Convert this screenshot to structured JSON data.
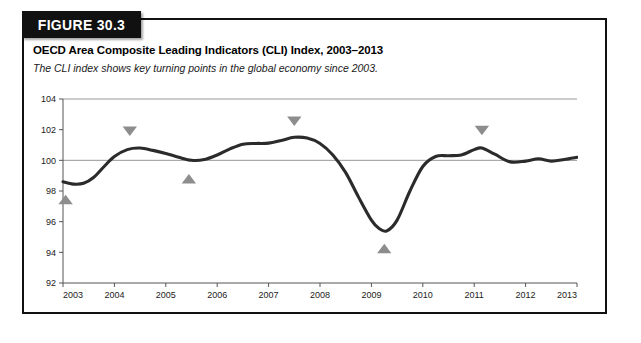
{
  "figure": {
    "banner_label": "FIGURE 30.3",
    "title": "OECD Area Composite Leading Indicators (CLI) Index, 2003–2013",
    "subtitle": "The CLI index shows key turning points in the global economy since 2003."
  },
  "colors": {
    "banner_background": "#111111",
    "banner_text": "#ffffff",
    "series_line": "#2b2b2b",
    "marker_gray": "#8d8d8d",
    "gridline": "#8c8c8c",
    "frame_border": "#111111"
  },
  "chart_data": {
    "type": "line",
    "title": "OECD Area Composite Leading Indicators (CLI) Index, 2003–2013",
    "subtitle": "The CLI index shows key turning points in the global economy since 2003.",
    "xlabel": "",
    "ylabel": "",
    "xlim": [
      2003,
      2013
    ],
    "ylim": [
      92,
      104
    ],
    "ytick_labels": [
      "92",
      "94",
      "96",
      "98",
      "100",
      "102",
      "104"
    ],
    "yticks": [
      92,
      94,
      96,
      98,
      100,
      102,
      104
    ],
    "xtick_labels": [
      "2003",
      "2004",
      "2005",
      "2006",
      "2007",
      "2008",
      "2009",
      "2010",
      "2011",
      "2012",
      "2013"
    ],
    "xticks": [
      2003,
      2004,
      2005,
      2006,
      2007,
      2008,
      2009,
      2010,
      2011,
      2012,
      2013
    ],
    "grid": "horizontal gridlines at 100 and 104 only",
    "legend": "none",
    "series": [
      {
        "name": "OECD Area Composite Leading Indicator (CLI)",
        "x": [
          2003.0,
          2003.2,
          2003.4,
          2003.6,
          2003.8,
          2004.0,
          2004.25,
          2004.5,
          2004.75,
          2005.0,
          2005.25,
          2005.5,
          2005.75,
          2006.0,
          2006.25,
          2006.5,
          2006.75,
          2007.0,
          2007.25,
          2007.5,
          2007.75,
          2008.0,
          2008.25,
          2008.5,
          2008.75,
          2009.0,
          2009.15,
          2009.3,
          2009.5,
          2009.75,
          2010.0,
          2010.25,
          2010.5,
          2010.75,
          2011.0,
          2011.15,
          2011.4,
          2011.7,
          2012.0,
          2012.25,
          2012.5,
          2012.75,
          2013.0
        ],
        "y": [
          98.6,
          98.45,
          98.5,
          98.9,
          99.6,
          100.25,
          100.7,
          100.8,
          100.65,
          100.45,
          100.2,
          100.0,
          100.05,
          100.35,
          100.75,
          101.05,
          101.1,
          101.12,
          101.3,
          101.5,
          101.45,
          101.1,
          100.35,
          99.2,
          97.6,
          96.1,
          95.55,
          95.4,
          96.1,
          98.0,
          99.6,
          100.25,
          100.3,
          100.35,
          100.7,
          100.8,
          100.4,
          99.9,
          99.95,
          100.1,
          99.95,
          100.05,
          100.2
        ]
      }
    ],
    "annotations": [
      {
        "name": "trough-marker-2003",
        "label": "trough",
        "shape": "up-triangle",
        "x": 2003.05,
        "y": 97.45,
        "color": "#8d8d8d"
      },
      {
        "name": "peak-marker-2004",
        "label": "peak",
        "shape": "down-triangle",
        "x": 2004.3,
        "y": 101.9,
        "color": "#8d8d8d"
      },
      {
        "name": "trough-marker-2005",
        "label": "trough",
        "shape": "up-triangle",
        "x": 2005.45,
        "y": 98.8,
        "color": "#8d8d8d"
      },
      {
        "name": "peak-marker-2007",
        "label": "peak",
        "shape": "down-triangle",
        "x": 2007.5,
        "y": 102.55,
        "color": "#8d8d8d"
      },
      {
        "name": "trough-marker-2009",
        "label": "trough",
        "shape": "up-triangle",
        "x": 2009.25,
        "y": 94.25,
        "color": "#8d8d8d"
      },
      {
        "name": "peak-marker-2011",
        "label": "peak",
        "shape": "down-triangle",
        "x": 2011.15,
        "y": 101.95,
        "color": "#8d8d8d"
      }
    ]
  }
}
